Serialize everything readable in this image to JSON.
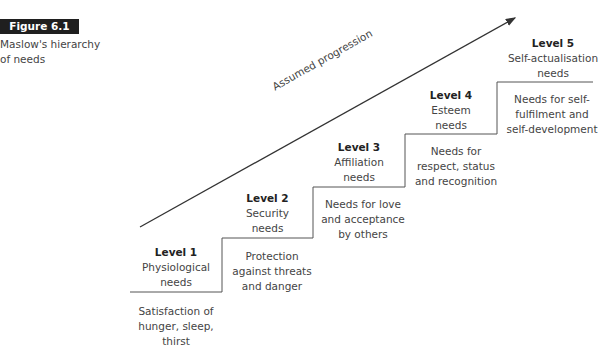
{
  "figure": {
    "badge": "Figure 6.1",
    "caption": "Maslow's hierarchy of needs"
  },
  "progression": {
    "label": "Assumed progression",
    "line_color": "#333333"
  },
  "levels": [
    {
      "title": "Level 1",
      "name_lines": [
        "Physiological",
        "needs"
      ],
      "desc_lines": [
        "Satisfaction of",
        "hunger, sleep,",
        "thirst"
      ]
    },
    {
      "title": "Level 2",
      "name_lines": [
        "Security",
        "needs"
      ],
      "desc_lines": [
        "Protection",
        "against threats",
        "and danger"
      ]
    },
    {
      "title": "Level 3",
      "name_lines": [
        "Affiliation",
        "needs"
      ],
      "desc_lines": [
        "Needs for love",
        "and acceptance",
        "by others"
      ]
    },
    {
      "title": "Level 4",
      "name_lines": [
        "Esteem",
        "needs"
      ],
      "desc_lines": [
        "Needs for",
        "respect, status",
        "and recognition"
      ]
    },
    {
      "title": "Level 5",
      "name_lines": [
        "Self-actualisation",
        "needs"
      ],
      "desc_lines": [
        "Needs for self-",
        "fulfilment and",
        "self-development"
      ]
    }
  ]
}
